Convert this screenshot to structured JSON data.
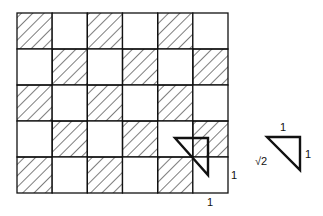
{
  "grid": {
    "cols": 6,
    "rows": 5,
    "pattern": "checkerboard, top-left cell hatched"
  },
  "labels": {
    "grid_side_label": "1",
    "grid_bottom_label": "1",
    "triangle_top": "1",
    "triangle_right": "1",
    "triangle_hyp": "√2"
  },
  "colors": {
    "line": "#111111",
    "background": "#ffffff"
  }
}
